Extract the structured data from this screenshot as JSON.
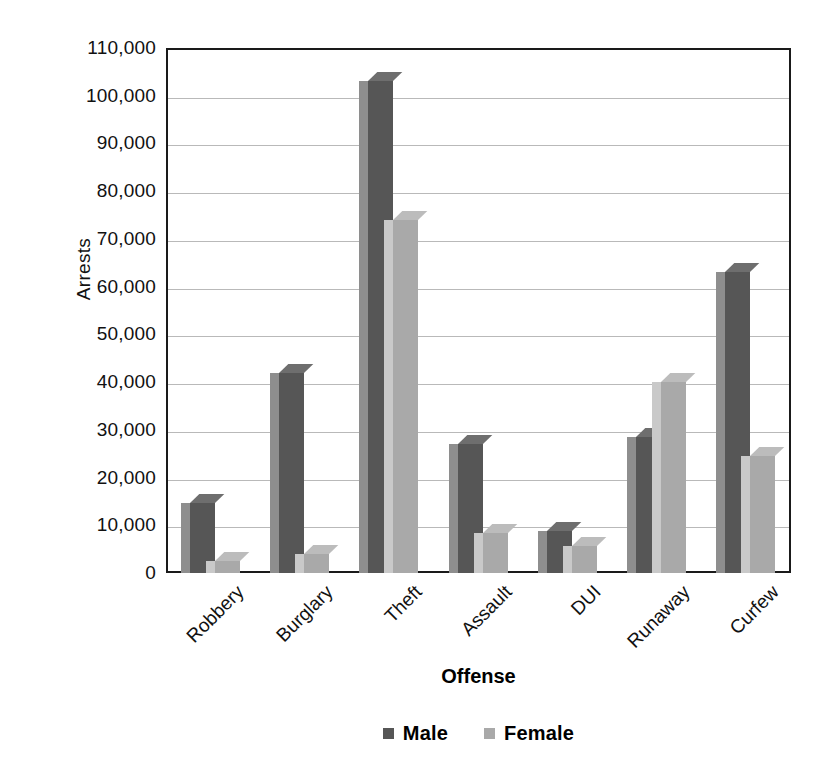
{
  "chart_data": {
    "type": "bar",
    "title": "",
    "subtitle": "",
    "xlabel": "Offense",
    "ylabel": "Arrests",
    "categories": [
      "Robbery",
      "Burglary",
      "Theft",
      "Assault",
      "DUI",
      "Runaway",
      "Curfew"
    ],
    "series": [
      {
        "name": "Male",
        "color": "#565656",
        "values": [
          14700,
          42000,
          103000,
          27000,
          8700,
          28500,
          63000
        ]
      },
      {
        "name": "Female",
        "color": "#a9a9a9",
        "values": [
          2500,
          4000,
          74000,
          8300,
          5600,
          40000,
          24500
        ]
      }
    ],
    "ylim": [
      0,
      110000
    ],
    "ytick_values": [
      0,
      10000,
      20000,
      30000,
      40000,
      50000,
      60000,
      70000,
      80000,
      90000,
      100000,
      110000
    ],
    "ytick_labels": [
      "0",
      "10,000",
      "20,000",
      "30,000",
      "40,000",
      "50,000",
      "60,000",
      "70,000",
      "80,000",
      "90,000",
      "100,000",
      "110,000"
    ],
    "grid": true,
    "grid_axis": "y",
    "legend_position": "bottom",
    "style": "3d-column",
    "xtick_rotation": -45
  },
  "axes": {
    "y_title": "Arrests",
    "x_title": "Offense"
  },
  "legend": {
    "items": [
      {
        "label": "Male",
        "color": "#565656"
      },
      {
        "label": "Female",
        "color": "#a9a9a9"
      }
    ]
  }
}
